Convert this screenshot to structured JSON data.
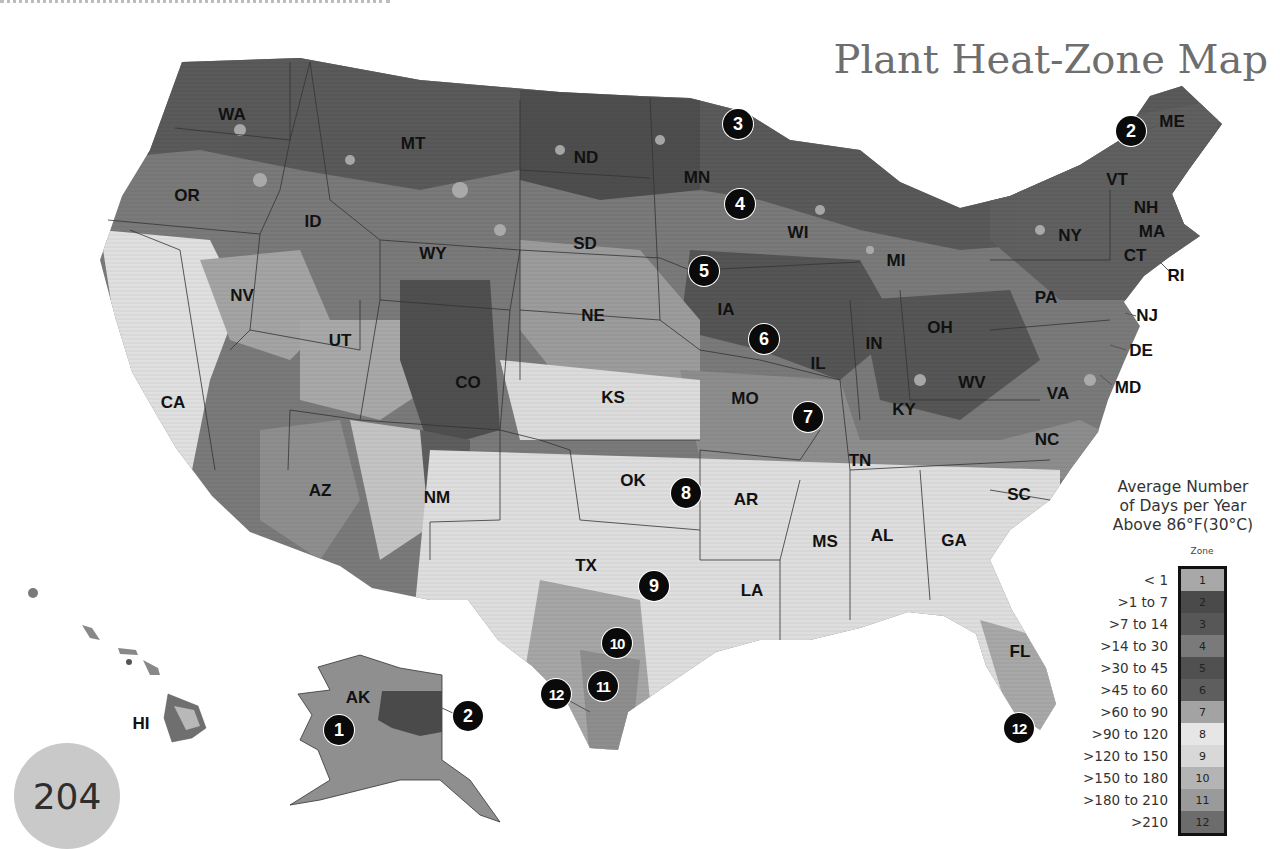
{
  "page": {
    "title": "Plant Heat-Zone Map",
    "page_number": "204"
  },
  "map": {
    "state_labels": [
      {
        "code": "WA",
        "x": 232,
        "y": 115
      },
      {
        "code": "OR",
        "x": 187,
        "y": 196
      },
      {
        "code": "ID",
        "x": 313,
        "y": 222
      },
      {
        "code": "MT",
        "x": 413,
        "y": 144
      },
      {
        "code": "WY",
        "x": 433,
        "y": 254
      },
      {
        "code": "ND",
        "x": 586,
        "y": 158
      },
      {
        "code": "SD",
        "x": 585,
        "y": 244
      },
      {
        "code": "NE",
        "x": 593,
        "y": 316
      },
      {
        "code": "MN",
        "x": 697,
        "y": 178
      },
      {
        "code": "WI",
        "x": 798,
        "y": 233
      },
      {
        "code": "MI",
        "x": 896,
        "y": 261
      },
      {
        "code": "IA",
        "x": 726,
        "y": 310
      },
      {
        "code": "IL",
        "x": 818,
        "y": 364
      },
      {
        "code": "IN",
        "x": 874,
        "y": 344
      },
      {
        "code": "OH",
        "x": 940,
        "y": 328
      },
      {
        "code": "NY",
        "x": 1070,
        "y": 236
      },
      {
        "code": "PA",
        "x": 1046,
        "y": 298
      },
      {
        "code": "VT",
        "x": 1117,
        "y": 180
      },
      {
        "code": "NH",
        "x": 1146,
        "y": 208
      },
      {
        "code": "MA",
        "x": 1152,
        "y": 232
      },
      {
        "code": "CT",
        "x": 1135,
        "y": 256
      },
      {
        "code": "RI",
        "x": 1176,
        "y": 276
      },
      {
        "code": "ME",
        "x": 1172,
        "y": 122
      },
      {
        "code": "NJ",
        "x": 1147,
        "y": 316
      },
      {
        "code": "DE",
        "x": 1141,
        "y": 351
      },
      {
        "code": "MD",
        "x": 1128,
        "y": 388
      },
      {
        "code": "WV",
        "x": 972,
        "y": 383
      },
      {
        "code": "VA",
        "x": 1058,
        "y": 394
      },
      {
        "code": "KY",
        "x": 904,
        "y": 410
      },
      {
        "code": "NC",
        "x": 1047,
        "y": 440
      },
      {
        "code": "TN",
        "x": 860,
        "y": 461
      },
      {
        "code": "SC",
        "x": 1019,
        "y": 495
      },
      {
        "code": "GA",
        "x": 954,
        "y": 541
      },
      {
        "code": "AL",
        "x": 882,
        "y": 536
      },
      {
        "code": "MS",
        "x": 825,
        "y": 542
      },
      {
        "code": "FL",
        "x": 1020,
        "y": 652
      },
      {
        "code": "LA",
        "x": 752,
        "y": 591
      },
      {
        "code": "AR",
        "x": 746,
        "y": 500
      },
      {
        "code": "MO",
        "x": 745,
        "y": 399
      },
      {
        "code": "KS",
        "x": 613,
        "y": 398
      },
      {
        "code": "OK",
        "x": 633,
        "y": 481
      },
      {
        "code": "TX",
        "x": 586,
        "y": 566
      },
      {
        "code": "NM",
        "x": 437,
        "y": 498
      },
      {
        "code": "AZ",
        "x": 320,
        "y": 491
      },
      {
        "code": "CO",
        "x": 468,
        "y": 383
      },
      {
        "code": "UT",
        "x": 340,
        "y": 341
      },
      {
        "code": "NV",
        "x": 242,
        "y": 296
      },
      {
        "code": "CA",
        "x": 173,
        "y": 403
      },
      {
        "code": "AK",
        "x": 358,
        "y": 698
      },
      {
        "code": "HI",
        "x": 141,
        "y": 724
      }
    ],
    "zone_markers": [
      {
        "zone": "1",
        "x": 339,
        "y": 730
      },
      {
        "zone": "2",
        "x": 468,
        "y": 716
      },
      {
        "zone": "2",
        "x": 1131,
        "y": 131
      },
      {
        "zone": "3",
        "x": 738,
        "y": 124
      },
      {
        "zone": "4",
        "x": 740,
        "y": 204
      },
      {
        "zone": "5",
        "x": 704,
        "y": 271
      },
      {
        "zone": "6",
        "x": 764,
        "y": 339
      },
      {
        "zone": "7",
        "x": 808,
        "y": 417
      },
      {
        "zone": "8",
        "x": 686,
        "y": 493
      },
      {
        "zone": "9",
        "x": 654,
        "y": 586
      },
      {
        "zone": "10",
        "x": 617,
        "y": 643
      },
      {
        "zone": "11",
        "x": 603,
        "y": 686
      },
      {
        "zone": "12",
        "x": 556,
        "y": 694
      },
      {
        "zone": "12",
        "x": 1019,
        "y": 728
      }
    ]
  },
  "legend": {
    "title_lines": [
      "Average Number",
      "of Days per Year",
      "Above 86°F(30°C)"
    ],
    "zone_header": "Zone",
    "rows": [
      {
        "zone": "1",
        "range": "< 1",
        "color": "#a8a8a8"
      },
      {
        "zone": "2",
        "range": ">1 to 7",
        "color": "#4a4a4a"
      },
      {
        "zone": "3",
        "range": ">7 to 14",
        "color": "#575757"
      },
      {
        "zone": "4",
        "range": ">14 to 30",
        "color": "#7a7a7a"
      },
      {
        "zone": "5",
        "range": ">30 to 45",
        "color": "#505050"
      },
      {
        "zone": "6",
        "range": ">45 to 60",
        "color": "#5e5e5e"
      },
      {
        "zone": "7",
        "range": ">60 to 90",
        "color": "#a3a3a3"
      },
      {
        "zone": "8",
        "range": ">90 to 120",
        "color": "#e6e6e6"
      },
      {
        "zone": "9",
        "range": ">120 to 150",
        "color": "#d8d8d8"
      },
      {
        "zone": "10",
        "range": ">150 to 180",
        "color": "#b4b4b4"
      },
      {
        "zone": "11",
        "range": ">180 to 210",
        "color": "#9a9a9a"
      },
      {
        "zone": "12",
        "range": ">210",
        "color": "#6c6c6c"
      }
    ]
  }
}
